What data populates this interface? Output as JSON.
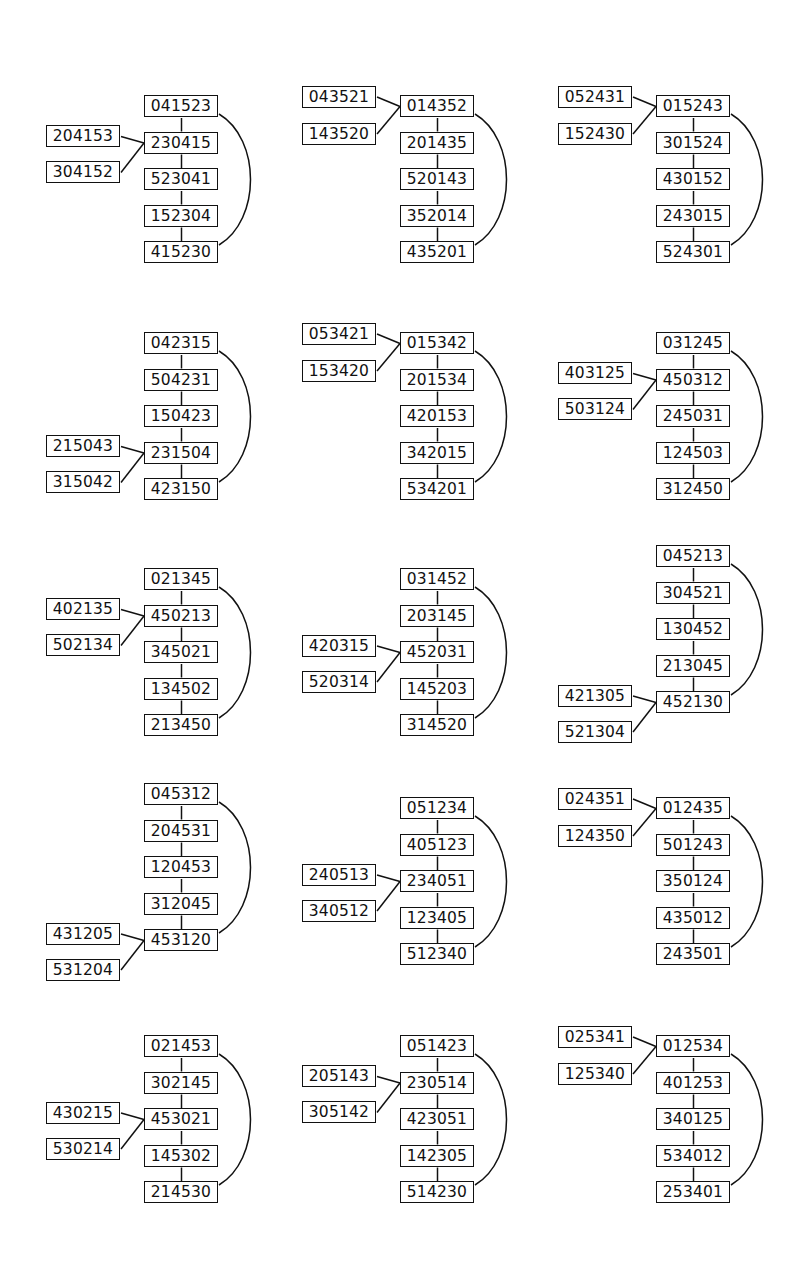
{
  "figure": {
    "diagrams": [
      {
        "chain": [
          "041523",
          "230415",
          "523041",
          "152304",
          "415230"
        ],
        "branch_index": 1,
        "branches": [
          "204153",
          "304152"
        ]
      },
      {
        "chain": [
          "014352",
          "201435",
          "520143",
          "352014",
          "435201"
        ],
        "branch_index": 0,
        "branches": [
          "043521",
          "143520"
        ]
      },
      {
        "chain": [
          "015243",
          "301524",
          "430152",
          "243015",
          "524301"
        ],
        "branch_index": 0,
        "branches": [
          "052431",
          "152430"
        ]
      },
      {
        "chain": [
          "042315",
          "504231",
          "150423",
          "231504",
          "423150"
        ],
        "branch_index": 3,
        "branches": [
          "215043",
          "315042"
        ]
      },
      {
        "chain": [
          "015342",
          "201534",
          "420153",
          "342015",
          "534201"
        ],
        "branch_index": 0,
        "branches": [
          "053421",
          "153420"
        ]
      },
      {
        "chain": [
          "031245",
          "450312",
          "245031",
          "124503",
          "312450"
        ],
        "branch_index": 1,
        "branches": [
          "403125",
          "503124"
        ]
      },
      {
        "chain": [
          "021345",
          "450213",
          "345021",
          "134502",
          "213450"
        ],
        "branch_index": 1,
        "branches": [
          "402135",
          "502134"
        ]
      },
      {
        "chain": [
          "031452",
          "203145",
          "452031",
          "145203",
          "314520"
        ],
        "branch_index": 2,
        "branches": [
          "420315",
          "520314"
        ]
      },
      {
        "chain": [
          "045213",
          "304521",
          "130452",
          "213045",
          "452130"
        ],
        "branch_index": 4,
        "branches": [
          "421305",
          "521304"
        ]
      },
      {
        "chain": [
          "045312",
          "204531",
          "120453",
          "312045",
          "453120"
        ],
        "branch_index": 4,
        "branches": [
          "431205",
          "531204"
        ]
      },
      {
        "chain": [
          "051234",
          "405123",
          "234051",
          "123405",
          "512340"
        ],
        "branch_index": 2,
        "branches": [
          "240513",
          "340512"
        ]
      },
      {
        "chain": [
          "012435",
          "501243",
          "350124",
          "435012",
          "243501"
        ],
        "branch_index": 0,
        "branches": [
          "024351",
          "124350"
        ]
      },
      {
        "chain": [
          "021453",
          "302145",
          "453021",
          "145302",
          "214530"
        ],
        "branch_index": 2,
        "branches": [
          "430215",
          "530214"
        ]
      },
      {
        "chain": [
          "051423",
          "230514",
          "423051",
          "142305",
          "514230"
        ],
        "branch_index": 1,
        "branches": [
          "205143",
          "305142"
        ]
      },
      {
        "chain": [
          "012534",
          "401253",
          "340125",
          "534012",
          "253401"
        ],
        "branch_index": 0,
        "branches": [
          "025341",
          "125340"
        ]
      }
    ]
  },
  "layout": {
    "origins": [
      [
        144,
        95
      ],
      [
        400,
        95
      ],
      [
        656,
        95
      ],
      [
        144,
        332
      ],
      [
        400,
        332
      ],
      [
        656,
        332
      ],
      [
        144,
        568
      ],
      [
        400,
        568
      ],
      [
        656,
        545
      ],
      [
        144,
        783
      ],
      [
        400,
        797
      ],
      [
        656,
        797
      ],
      [
        144,
        1035
      ],
      [
        400,
        1035
      ],
      [
        656,
        1035
      ]
    ],
    "chain_offsets": [
      [
        0,
        0,
        0,
        0,
        0
      ],
      [
        0,
        0,
        0,
        0,
        0
      ],
      [
        0,
        0,
        0,
        0,
        0
      ],
      [
        0,
        0,
        0,
        0,
        0
      ],
      [
        0,
        0,
        0,
        0,
        0
      ],
      [
        0,
        0,
        0,
        0,
        0
      ],
      [
        0,
        0,
        0,
        0,
        0
      ],
      [
        0,
        0,
        0,
        0,
        0
      ],
      [
        0,
        0,
        0,
        0,
        0
      ],
      [
        0,
        0,
        0,
        0,
        0
      ],
      [
        0,
        0,
        0,
        0,
        0
      ],
      [
        0,
        0,
        0,
        0,
        0
      ],
      [
        0,
        0,
        0,
        0,
        0
      ],
      [
        0,
        0,
        0,
        0,
        0
      ],
      [
        0,
        0,
        0,
        0,
        0
      ]
    ]
  }
}
